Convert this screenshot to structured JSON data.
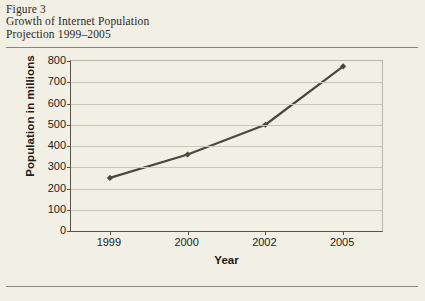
{
  "figure": {
    "caption_lines": [
      "Figure 3",
      "Growth of Internet Population",
      "Projection 1999–2005"
    ]
  },
  "chart_data": {
    "type": "line",
    "title": "Growth of Internet Population Projection 1999–2005",
    "categories": [
      "1999",
      "2000",
      "2002",
      "2005"
    ],
    "values": [
      250,
      360,
      500,
      775
    ],
    "xlabel": "Year",
    "ylabel": "Population in millions",
    "ylim": [
      0,
      800
    ],
    "yticks": [
      0,
      100,
      200,
      300,
      400,
      500,
      600,
      700,
      800
    ],
    "ytick_labels": [
      "0",
      "100",
      "200",
      "300",
      "400",
      "500",
      "600",
      "700",
      "800"
    ],
    "grid": "horizontal",
    "legend": "none",
    "series_color": "#4a4940",
    "marker": "diamond"
  },
  "colors": {
    "page_background": "#f2efe4",
    "rule": "#8b8879",
    "axis": "#55534a",
    "gridline": "#c9c6b8",
    "text": "#1c1c1a"
  }
}
